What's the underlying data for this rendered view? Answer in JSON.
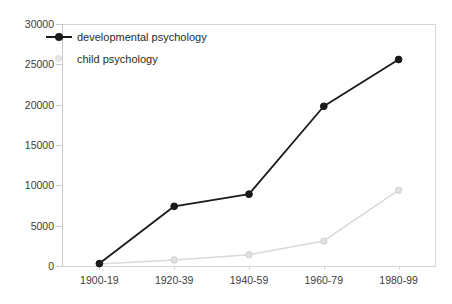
{
  "chart_data": {
    "type": "line",
    "title": "",
    "xlabel": "",
    "ylabel": "",
    "categories": [
      "1900-19",
      "1920-39",
      "1940-59",
      "1960-79",
      "1980-99"
    ],
    "series": [
      {
        "name": "developmental psychology",
        "color": "#1a1a1a",
        "marker": "filled-circle",
        "values": [
          300,
          7400,
          8900,
          19800,
          25600
        ]
      },
      {
        "name": "child psychology",
        "color": "#d9d9d9",
        "marker": "filled-circle-light",
        "values": [
          250,
          750,
          1400,
          3100,
          9400
        ]
      }
    ],
    "ylim": [
      0,
      30000
    ],
    "yticks": [
      0,
      5000,
      10000,
      15000,
      20000,
      25000,
      30000
    ],
    "ytick_labels": [
      "0",
      "5000",
      "10000",
      "15000",
      "20000",
      "25000",
      "30000"
    ],
    "grid": false,
    "legend_position": "top-left",
    "axis_color": "#d4d4d4",
    "text_color": "#3b3b3b"
  }
}
